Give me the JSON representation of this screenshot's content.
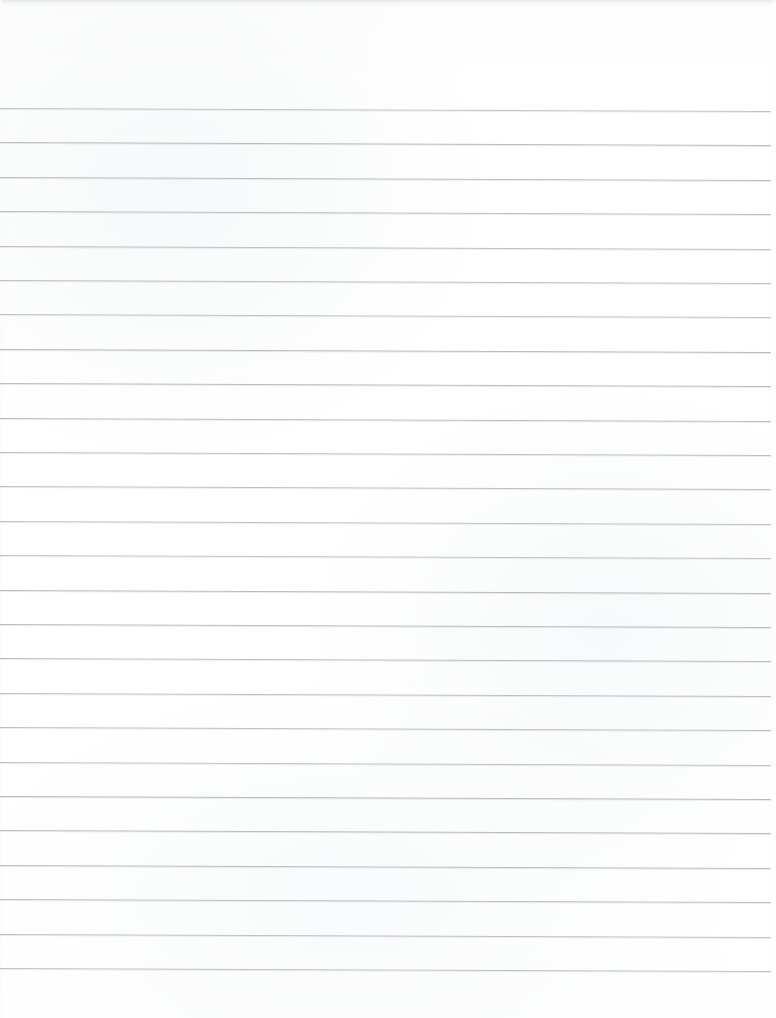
{
  "document": {
    "kind": "scanned-ruled-notebook-paper",
    "title": "Blank lined paper",
    "visible_text": "",
    "handwriting_present": "no",
    "printed_text_present": "no"
  },
  "page": {
    "width": 776,
    "height": 1018,
    "background_color": "#fefefe",
    "paper_tone": "near-white with faint gray scan mottling"
  },
  "rules": {
    "count": 26,
    "color": "#b4b8bc",
    "thickness_px": 1,
    "first_line_y": 108,
    "spacing_px": 34.4,
    "left_x": 0,
    "right_x": 771,
    "skew_degrees": 0.22,
    "orientation": "horizontal",
    "y_positions": [
      108,
      142.4,
      176.8,
      211.2,
      245.6,
      280,
      314.4,
      348.8,
      383.2,
      417.6,
      452,
      486.4,
      520.8,
      555.2,
      589.6,
      624,
      658.4,
      692.8,
      727.2,
      761.6,
      796,
      830.4,
      864.8,
      899.2,
      933.6,
      968
    ]
  },
  "margins": {
    "top_blank_px": 108,
    "bottom_blank_px": 50,
    "left_margin_rule": "none",
    "right_gap_px": 5
  },
  "scan_artifacts": {
    "top_edge_band_color": "#e2e4e6",
    "top_edge_band_height_px": 7,
    "left_gutter_strip_px": 4,
    "right_gutter_strip_px": 7
  }
}
